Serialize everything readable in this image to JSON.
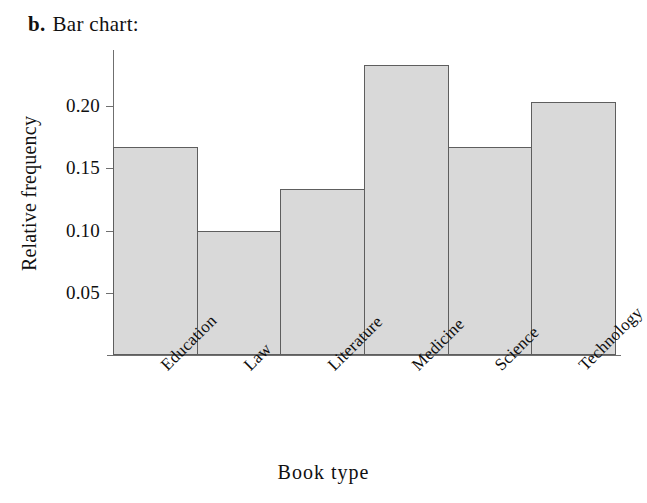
{
  "title": {
    "marker": "b.",
    "text": "Bar chart:"
  },
  "chart_data": {
    "type": "bar",
    "title": "Bar chart:",
    "categories": [
      "Education",
      "Law",
      "Literature",
      "Medicine",
      "Science",
      "Technology"
    ],
    "values": [
      0.1667,
      0.1,
      0.1333,
      0.2333,
      0.1667,
      0.2033
    ],
    "xlabel": "Book type",
    "ylabel": "Relative frequency",
    "ylim": [
      0,
      0.245
    ],
    "yticks": [
      0.05,
      0.1,
      0.15,
      0.2
    ],
    "ytick_labels": [
      "0.05",
      "0.10",
      "0.15",
      "0.20"
    ],
    "grid": false,
    "legend": false,
    "bar_fill_color": "#d9d9d9",
    "bar_border_color": "#5e5e5e",
    "axis_color": "#6f6f6f"
  }
}
